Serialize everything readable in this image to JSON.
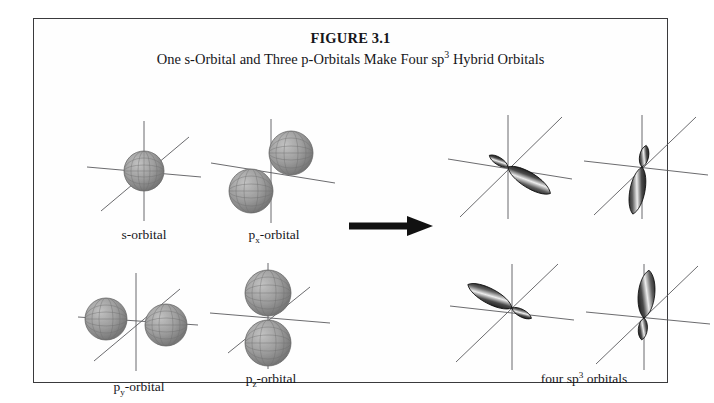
{
  "figure": {
    "number": "FIGURE 3.1",
    "title_before": "One s-Orbital and Three p-Orbitals Make Four sp",
    "title_sup": "3",
    "title_after": " Hybrid Orbitals",
    "border_color": "#3a3a3c",
    "background_color": "#ffffff"
  },
  "arrow": {
    "name": "transformation-arrow",
    "direction": "right",
    "color": "#111111"
  },
  "orbitals": {
    "s": {
      "label_main": "s",
      "label_sub": "",
      "label_suffix": "-orbital",
      "type": "sphere",
      "lobe_count": 1
    },
    "px": {
      "label_main": "p",
      "label_sub": "x",
      "label_suffix": "-orbital",
      "type": "dumbbell",
      "lobe_count": 2,
      "axis": "diagonal-up-right"
    },
    "py": {
      "label_main": "p",
      "label_sub": "y",
      "label_suffix": "-orbital",
      "type": "dumbbell",
      "lobe_count": 2,
      "axis": "horizontal"
    },
    "pz": {
      "label_main": "p",
      "label_sub": "z",
      "label_suffix": "-orbital",
      "type": "dumbbell",
      "lobe_count": 2,
      "axis": "vertical"
    }
  },
  "hybrids": {
    "group_label_before": "four sp",
    "group_label_sup": "3",
    "group_label_after": " orbitals",
    "items": [
      {
        "name": "sp3-orbital-1",
        "major_lobe_direction": "lower-right"
      },
      {
        "name": "sp3-orbital-2",
        "major_lobe_direction": "down"
      },
      {
        "name": "sp3-orbital-3",
        "major_lobe_direction": "lower-left"
      },
      {
        "name": "sp3-orbital-4",
        "major_lobe_direction": "up"
      }
    ]
  },
  "colors": {
    "sphere_fill": "#9a9a9a",
    "sphere_mesh": "#6f6f6f",
    "lobe_dark": "#161616",
    "lobe_light": "#f2f2f2",
    "axis": "#5a5a5e"
  }
}
